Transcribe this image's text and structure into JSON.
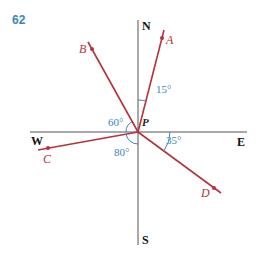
{
  "problem_number": "62",
  "compass": {
    "north": "N",
    "south": "S",
    "east": "E",
    "west": "W",
    "center": "P"
  },
  "points": [
    {
      "label": "A",
      "bearing": "N 15° E"
    },
    {
      "label": "B",
      "bearing": "N 30° W"
    },
    {
      "label": "C",
      "bearing": "S 80° W"
    },
    {
      "label": "D",
      "bearing": "S 55° E"
    }
  ],
  "angles": {
    "a": "15°",
    "b": "60°",
    "c": "80°",
    "d": "35°"
  },
  "colors": {
    "ray": "#b5323c",
    "axis": "#555555",
    "angle": "#3d86b8",
    "number": "#3d86b8"
  }
}
